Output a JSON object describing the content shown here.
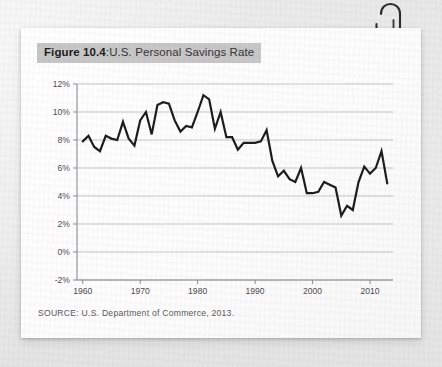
{
  "figure": {
    "label": "Figure 10.4",
    "separator": ":",
    "caption": "U.S. Personal Savings Rate",
    "source": "SOURCE: U.S. Department of Commerce, 2013."
  },
  "decoration": {
    "paperclip_icon": "paperclip-icon",
    "card_background": "#fdfdfd",
    "page_background": "#ececec",
    "title_highlight": "#c6c6c6"
  },
  "chart_data": {
    "type": "line",
    "title": "U.S. Personal Savings Rate",
    "xlabel": "",
    "ylabel": "",
    "xlim": [
      1959,
      2014
    ],
    "ylim": [
      -2,
      12
    ],
    "xticks": [
      1960,
      1970,
      1980,
      1990,
      2000,
      2010
    ],
    "xtick_labels": [
      "1960",
      "1970",
      "1980",
      "1990",
      "2000",
      "2010"
    ],
    "yticks": [
      -2,
      0,
      2,
      4,
      6,
      8,
      10,
      12
    ],
    "ytick_labels": [
      "-2%",
      "0%",
      "2%",
      "4%",
      "6%",
      "8%",
      "10%",
      "12%"
    ],
    "grid": "horizontal",
    "legend": "none",
    "line_color": "#1a1a1a",
    "line_width": 2.2,
    "series": [
      {
        "name": "Personal Savings Rate",
        "x": [
          1960,
          1961,
          1962,
          1963,
          1964,
          1965,
          1966,
          1967,
          1968,
          1969,
          1970,
          1971,
          1972,
          1973,
          1974,
          1975,
          1976,
          1977,
          1978,
          1979,
          1980,
          1981,
          1982,
          1983,
          1984,
          1985,
          1986,
          1987,
          1988,
          1989,
          1990,
          1991,
          1992,
          1993,
          1994,
          1995,
          1996,
          1997,
          1998,
          1999,
          2000,
          2001,
          2002,
          2003,
          2004,
          2005,
          2006,
          2007,
          2008,
          2009,
          2010,
          2011,
          2012,
          2013
        ],
        "values": [
          7.9,
          8.3,
          7.5,
          7.2,
          8.3,
          8.1,
          8.0,
          9.3,
          8.1,
          7.6,
          9.4,
          10.0,
          8.4,
          10.5,
          10.7,
          10.6,
          9.4,
          8.6,
          9.0,
          8.9,
          10.0,
          11.2,
          10.9,
          8.8,
          10.0,
          8.2,
          8.2,
          7.3,
          7.8,
          7.8,
          7.8,
          7.9,
          8.7,
          6.5,
          5.4,
          5.8,
          5.2,
          5.0,
          6.0,
          4.2,
          4.2,
          4.3,
          5.0,
          4.8,
          4.6,
          2.6,
          3.3,
          3.0,
          5.0,
          6.1,
          5.6,
          6.0,
          7.2,
          4.9
        ],
        "annotations": [
          {
            "label": "peak",
            "x": 1982,
            "y": 11.2
          },
          {
            "label": "trough",
            "x": 2005,
            "y": 2.6
          }
        ]
      }
    ]
  }
}
